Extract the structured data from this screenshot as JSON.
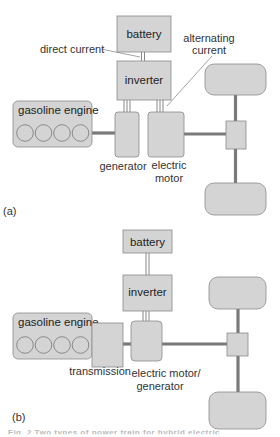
{
  "panel_a": {
    "tag": "(a)",
    "battery": "battery",
    "inverter": "inverter",
    "gasoline_engine": "gasoline engine",
    "generator": "generator",
    "electric_motor_line1": "electric",
    "electric_motor_line2": "motor",
    "direct_current": "direct current",
    "alternating_current_line1": "alternating",
    "alternating_current_line2": "current"
  },
  "panel_b": {
    "tag": "(b)",
    "battery": "battery",
    "inverter": "inverter",
    "gasoline_engine": "gasoline engine",
    "transmission": "transmission",
    "motor_generator_line1": "electric motor/",
    "motor_generator_line2": "generator"
  },
  "caption": "Fig. 2  Two types of power train for hybrid electric",
  "colors": {
    "component_fill": "#d4d4d4",
    "component_stroke": "#8a8a8a",
    "shaft": "#7a7a7a",
    "text": "#333333"
  }
}
